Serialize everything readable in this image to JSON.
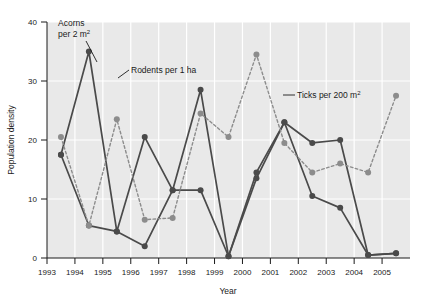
{
  "chart_data": {
    "type": "line",
    "title": "",
    "xlabel": "Year",
    "ylabel": "Population density",
    "xlim": [
      1993,
      2006
    ],
    "ylim": [
      0,
      42
    ],
    "grid": true,
    "legend_position": "inline-annotations",
    "xticks": [
      1993,
      1994,
      1995,
      1996,
      1997,
      1998,
      1999,
      2000,
      2001,
      2002,
      2003,
      2004,
      2005
    ],
    "yticks": [
      0,
      10,
      20,
      30,
      40
    ],
    "x": [
      1993.5,
      1994.5,
      1995.5,
      1996.5,
      1997.5,
      1998.5,
      1999.5,
      2000.5,
      2001.5,
      2002.5,
      2003.5,
      2004.5,
      2005.5
    ],
    "series": [
      {
        "name": "Acorns per 2 m²",
        "style": "solid",
        "color": "#4a4a4a",
        "marker": "circle",
        "values": [
          17.5,
          35.0,
          4.5,
          20.5,
          11.5,
          11.5,
          0.3,
          14.5,
          23.0,
          19.5,
          20.0,
          0.5,
          0.8
        ]
      },
      {
        "name": "Rodents per 1 ha",
        "style": "solid",
        "color": "#4a4a4a",
        "marker": "circle",
        "values": [
          17.5,
          5.5,
          4.5,
          2.0,
          11.5,
          28.5,
          0.3,
          13.5,
          23.0,
          10.5,
          8.5,
          0.5,
          0.8
        ]
      },
      {
        "name": "Ticks per 200 m²",
        "style": "dashed",
        "color": "#8c8c8c",
        "marker": "circle",
        "values": [
          20.5,
          5.5,
          23.5,
          6.5,
          6.8,
          24.5,
          20.5,
          34.5,
          19.5,
          14.5,
          16.0,
          14.5,
          27.5
        ]
      }
    ],
    "annotations": [
      {
        "text": "Acorns",
        "text2": "per 2 m",
        "sup": "2",
        "series": "Acorns per 2 m²"
      },
      {
        "text": "Rodents per 1 ha",
        "series": "Rodents per 1 ha"
      },
      {
        "text": "Ticks per 200 m",
        "sup": "2",
        "series": "Ticks per 200 m²"
      }
    ],
    "colors": {
      "plot_background": "#e9e9e9",
      "gridline": "#ffffff",
      "axis": "#1a1a1a",
      "dark_series": "#4a4a4a",
      "gray_series": "#8c8c8c"
    }
  }
}
